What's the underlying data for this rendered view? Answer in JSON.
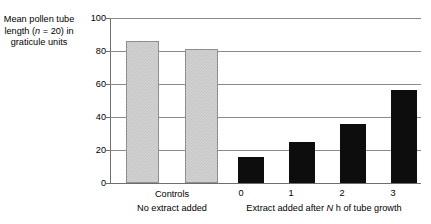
{
  "chart_data": {
    "type": "bar",
    "title": "",
    "ylabel": "Mean pollen tube length (n = 20) in graticule units",
    "ylabel_parts": {
      "line1": "Mean pollen tube",
      "line2_pre": "length (",
      "line2_italic": "n",
      "line2_post": " = 20) in",
      "line3": "graticule units"
    },
    "xlabel": "",
    "ylim": [
      0,
      100
    ],
    "yticks": [
      0,
      20,
      40,
      60,
      80,
      100
    ],
    "ytick_labels": [
      "0",
      "20",
      "40",
      "60",
      "80",
      "100"
    ],
    "grid": true,
    "legend": "none",
    "categories": [
      "",
      "",
      "0",
      "1",
      "2",
      "3"
    ],
    "values": [
      86,
      81,
      16,
      25,
      36,
      56.5
    ],
    "bars": [
      {
        "label": "",
        "value": 86,
        "style": "light",
        "group": "controls"
      },
      {
        "label": "",
        "value": 81,
        "style": "light",
        "group": "controls"
      },
      {
        "label": "0",
        "value": 16,
        "style": "dark",
        "group": "extract"
      },
      {
        "label": "1",
        "value": 25,
        "style": "dark",
        "group": "extract"
      },
      {
        "label": "2",
        "value": 36,
        "style": "dark",
        "group": "extract"
      },
      {
        "label": "3",
        "value": 56.5,
        "style": "dark",
        "group": "extract"
      }
    ],
    "groups": [
      {
        "name": "controls",
        "line1": "Controls",
        "line2": "No extract added"
      },
      {
        "name": "extract",
        "line1": "",
        "line2_pre": "Extract added after ",
        "line2_italic": "N",
        "line2_post": " h of tube growth"
      }
    ],
    "colors": {
      "light_bar_fill": "#d4d4d4",
      "light_bar_pattern": "#c2c2c2",
      "light_bar_border": "#8f8f8f",
      "dark_bar_fill": "#0d0d0d",
      "gridline": "#8a8a8a",
      "axis": "#6e6e6e",
      "text": "#000000",
      "background": "#ffffff"
    }
  },
  "ticks": {
    "t0": "0",
    "t20": "20",
    "t40": "40",
    "t60": "60",
    "t80": "80",
    "t100": "100"
  },
  "xlabels": {
    "b2": "0",
    "b3": "1",
    "b4": "2",
    "b5": "3"
  },
  "groups": {
    "controls_line1": "Controls",
    "controls_line2": "No extract added",
    "extract_line2_pre": "Extract added after ",
    "extract_line2_italic": "N",
    "extract_line2_post": " h of tube growth"
  },
  "ytitle": {
    "line1": "Mean pollen tube",
    "line2_pre": "length (",
    "line2_italic": "n",
    "line2_post": " = 20) in",
    "line3": "graticule units"
  }
}
